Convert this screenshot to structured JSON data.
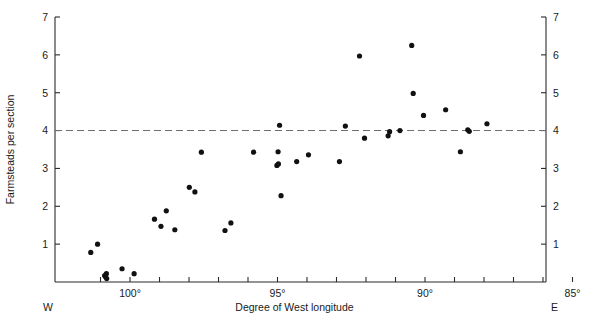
{
  "chart_data": {
    "type": "scatter",
    "title": "",
    "xlabel": "Degree of West longitude",
    "ylabel": "Farmsteads per section",
    "xlim": [
      101.6,
      85.0
    ],
    "ylim": [
      0,
      7
    ],
    "x_axis_inverted": true,
    "grid": false,
    "legend": null,
    "x_ticklabels": [
      "100°",
      "95°",
      "90°",
      "85°"
    ],
    "x_ticks_major": [
      100,
      95,
      90,
      85
    ],
    "x_ticks_minor": [
      101,
      99,
      98,
      97,
      96,
      94,
      93,
      92,
      91,
      89,
      88,
      87,
      86
    ],
    "y_ticklabels": [
      "1",
      "2",
      "3",
      "4",
      "5",
      "6",
      "7"
    ],
    "y_ticks": [
      1,
      2,
      3,
      4,
      5,
      6,
      7
    ],
    "right_axis_ticklabels": [
      "1",
      "2",
      "3",
      "4",
      "5",
      "6",
      "7"
    ],
    "corner_labels": {
      "left": "W",
      "right": "E"
    },
    "annotations": [
      {
        "type": "reference-line",
        "orientation": "horizontal",
        "y": 4,
        "style": "dashed",
        "color": "#6e6e6e"
      }
    ],
    "points": [
      {
        "x": 101.33,
        "y": 0.78
      },
      {
        "x": 101.1,
        "y": 1.0
      },
      {
        "x": 100.86,
        "y": 0.17
      },
      {
        "x": 100.83,
        "y": 0.14
      },
      {
        "x": 100.8,
        "y": 0.22
      },
      {
        "x": 100.79,
        "y": 0.09
      },
      {
        "x": 100.27,
        "y": 0.35
      },
      {
        "x": 99.86,
        "y": 0.22
      },
      {
        "x": 99.17,
        "y": 1.66
      },
      {
        "x": 98.95,
        "y": 1.47
      },
      {
        "x": 98.77,
        "y": 1.88
      },
      {
        "x": 98.48,
        "y": 1.38
      },
      {
        "x": 97.99,
        "y": 2.5
      },
      {
        "x": 97.8,
        "y": 2.38
      },
      {
        "x": 97.58,
        "y": 3.43
      },
      {
        "x": 96.78,
        "y": 1.36
      },
      {
        "x": 96.58,
        "y": 1.56
      },
      {
        "x": 95.81,
        "y": 3.43
      },
      {
        "x": 95.02,
        "y": 3.08
      },
      {
        "x": 94.97,
        "y": 3.12
      },
      {
        "x": 94.98,
        "y": 3.44
      },
      {
        "x": 94.93,
        "y": 4.14
      },
      {
        "x": 94.88,
        "y": 2.28
      },
      {
        "x": 94.35,
        "y": 3.18
      },
      {
        "x": 93.95,
        "y": 3.36
      },
      {
        "x": 92.9,
        "y": 3.18
      },
      {
        "x": 92.7,
        "y": 4.12
      },
      {
        "x": 92.22,
        "y": 5.97
      },
      {
        "x": 92.05,
        "y": 3.8
      },
      {
        "x": 91.25,
        "y": 3.86
      },
      {
        "x": 91.2,
        "y": 3.97
      },
      {
        "x": 90.85,
        "y": 4.0
      },
      {
        "x": 90.45,
        "y": 6.25
      },
      {
        "x": 90.4,
        "y": 4.98
      },
      {
        "x": 90.05,
        "y": 4.4
      },
      {
        "x": 89.3,
        "y": 4.55
      },
      {
        "x": 88.8,
        "y": 3.44
      },
      {
        "x": 88.55,
        "y": 4.02
      },
      {
        "x": 88.5,
        "y": 3.98
      },
      {
        "x": 87.9,
        "y": 4.18
      }
    ]
  },
  "geometry": {
    "plot_left_px": 55,
    "plot_right_px": 546,
    "plot_bottom_px": 282,
    "plot_top_px": 17,
    "x_at_100deg_px": 130,
    "x_at_90deg_px": 425,
    "y_at_0_px": 282,
    "y_at_7_px": 17
  }
}
